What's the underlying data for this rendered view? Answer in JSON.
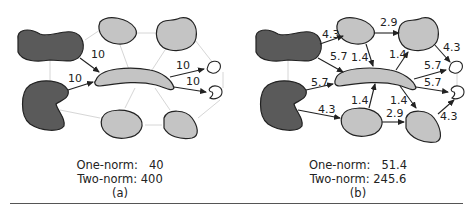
{
  "colors": {
    "dark_region": "#5a5a5a",
    "light_region": "#c4c4c4",
    "outline": "#222222",
    "faint_edge": "#d6d6d6",
    "arrow": "#222222",
    "text": "#222222"
  },
  "panel_a": {
    "edge_labels": [
      "10",
      "10",
      "10",
      "10"
    ],
    "caption": {
      "one_norm_label": "One-norm:",
      "one_norm_value": "40",
      "two_norm_label": "Two-norm:",
      "two_norm_value": "400",
      "tag": "(a)"
    }
  },
  "panel_b": {
    "edge_labels": [
      "4.3",
      "5.7",
      "2.9",
      "1.4",
      "1.4",
      "4.3",
      "5.7",
      "5.7",
      "5.7",
      "1.4",
      "1.4",
      "4.3",
      "2.9",
      "4.3"
    ],
    "caption": {
      "one_norm_label": "One-norm:",
      "one_norm_value": "51.4",
      "two_norm_label": "Two-norm:",
      "two_norm_value": "245.6",
      "tag": "(b)"
    }
  }
}
